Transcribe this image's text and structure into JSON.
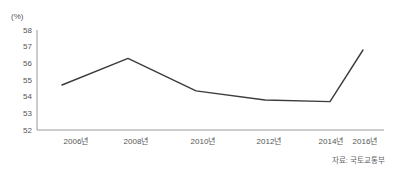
{
  "chart_data": {
    "type": "line",
    "title": "",
    "subtitle": "",
    "unit_label": "(%)",
    "xlabel": "",
    "ylabel": "",
    "categories": [
      "2006년",
      "2008년",
      "2010년",
      "2012년",
      "2014년",
      "2016년"
    ],
    "values": [
      54.7,
      56.3,
      54.35,
      53.8,
      53.7,
      56.8
    ],
    "series": [
      {
        "name": "",
        "values": [
          54.7,
          56.3,
          54.35,
          53.8,
          53.7,
          56.8
        ]
      }
    ],
    "ylim": [
      52,
      58
    ],
    "y_ticks": [
      58,
      57,
      56,
      55,
      54,
      53,
      52
    ],
    "y_tick_labels": [
      "58",
      "57",
      "56",
      "55",
      "54",
      "53",
      "52"
    ],
    "grid": false,
    "legend": "none",
    "line_color": "#3c3c3c",
    "axis_color": "#9a9a9a",
    "background_color": "#ffffff"
  },
  "footer": {
    "source_note": "자료: 국토교통부"
  }
}
